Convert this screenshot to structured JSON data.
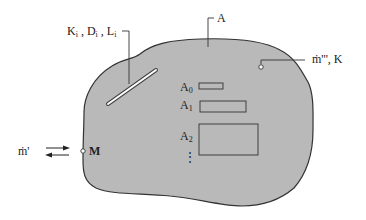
{
  "diagram": {
    "type": "control-volume schematic",
    "colors": {
      "region_fill": "#b9b9b9",
      "outline": "#333333",
      "background": "#ffffff",
      "crack": "#ffffff"
    },
    "labels": {
      "region": "A",
      "crack": {
        "K": "K",
        "D": "D",
        "L": "L",
        "subscript": "i",
        "sep": ","
      },
      "source": {
        "main": "ṁ'''",
        "sep": ",",
        "K": "K"
      },
      "boundary_flux": "ṁ'",
      "boundary_point": "M",
      "subareas": [
        {
          "base": "A",
          "sub": "0"
        },
        {
          "base": "A",
          "sub": "1"
        },
        {
          "base": "A",
          "sub": "2"
        }
      ],
      "ellipsis": "⋮"
    }
  }
}
